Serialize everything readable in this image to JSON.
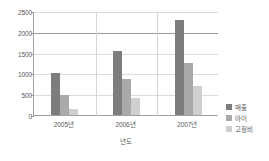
{
  "chart_data": {
    "type": "bar",
    "title": "",
    "subtitle": "",
    "xlabel": "년도",
    "ylabel": "",
    "categories": [
      "2005년",
      "2006년",
      "2007년"
    ],
    "series": [
      {
        "name": "매출",
        "values": [
          1000,
          1550,
          2280
        ],
        "color": "#7d7d7d"
      },
      {
        "name": "아이",
        "values": [
          480,
          860,
          1250
        ],
        "color": "#aaaaaa"
      },
      {
        "name": "고정비",
        "values": [
          140,
          410,
          690
        ],
        "color": "#cfcfcf"
      }
    ],
    "ylim": [
      0,
      2500
    ],
    "yticks": [
      0,
      500,
      1000,
      1500,
      2000,
      2500
    ],
    "ytick_labels": [
      "0",
      "500",
      "1000",
      "1500",
      "2000",
      "2500"
    ],
    "grid": true,
    "grid_major_value": 2000,
    "legend_position": "right",
    "background": "#ffffff",
    "axis_color": "#a0a0a0",
    "grid_color": "#dcdcdc",
    "text_color": "#58595b"
  }
}
